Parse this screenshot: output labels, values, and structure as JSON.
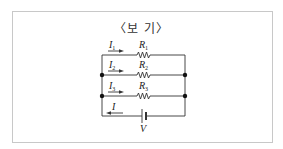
{
  "box": {
    "title": "〈보 기〉"
  },
  "circuit": {
    "branches": [
      {
        "current_label": "I",
        "current_sub": "1",
        "resistor_label": "R",
        "resistor_sub": "1"
      },
      {
        "current_label": "I",
        "current_sub": "2",
        "resistor_label": "R",
        "resistor_sub": "2"
      },
      {
        "current_label": "I",
        "current_sub": "3",
        "resistor_label": "R",
        "resistor_sub": "3"
      }
    ],
    "total_current_label": "I",
    "battery_label": "V"
  },
  "colors": {
    "wire": "#333333",
    "frame": "#c8c8c8",
    "text": "#222222"
  }
}
